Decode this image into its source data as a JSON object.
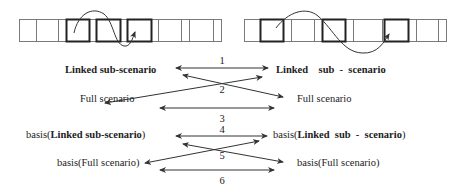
{
  "strips": [
    {
      "name": "left-strip",
      "top": 19,
      "bottom": 41,
      "cells": [
        {
          "x1": 19,
          "x2": 36,
          "bold": false
        },
        {
          "x1": 36,
          "x2": 58,
          "bold": false
        },
        {
          "x1": 58,
          "x2": 66,
          "bold": false
        },
        {
          "x1": 66,
          "x2": 89,
          "bold": true
        },
        {
          "x1": 89,
          "x2": 96,
          "bold": false
        },
        {
          "x1": 96,
          "x2": 120,
          "bold": true
        },
        {
          "x1": 120,
          "x2": 127,
          "bold": false
        },
        {
          "x1": 127,
          "x2": 151,
          "bold": true
        },
        {
          "x1": 151,
          "x2": 158,
          "bold": false
        },
        {
          "x1": 158,
          "x2": 181,
          "bold": false
        },
        {
          "x1": 181,
          "x2": 189,
          "bold": false
        },
        {
          "x1": 189,
          "x2": 213,
          "bold": false
        },
        {
          "x1": 213,
          "x2": 221,
          "bold": false
        }
      ],
      "curve": "M74,33 C78,14 92,6 104,14 C114,22 114,44 124,46 C130,47 132,40 135,32"
    },
    {
      "name": "right-strip",
      "top": 19,
      "bottom": 41,
      "cells": [
        {
          "x1": 244,
          "x2": 260,
          "bold": false
        },
        {
          "x1": 260,
          "x2": 283,
          "bold": true
        },
        {
          "x1": 283,
          "x2": 291,
          "bold": false
        },
        {
          "x1": 291,
          "x2": 314,
          "bold": false
        },
        {
          "x1": 314,
          "x2": 322,
          "bold": false
        },
        {
          "x1": 322,
          "x2": 345,
          "bold": true
        },
        {
          "x1": 345,
          "x2": 353,
          "bold": false
        },
        {
          "x1": 353,
          "x2": 382,
          "bold": false
        },
        {
          "x1": 382,
          "x2": 384,
          "bold": false
        },
        {
          "x1": 384,
          "x2": 408,
          "bold": true
        },
        {
          "x1": 408,
          "x2": 416,
          "bold": false
        },
        {
          "x1": 416,
          "x2": 438,
          "bold": false
        },
        {
          "x1": 438,
          "x2": 446,
          "bold": false
        }
      ],
      "curve": "M276,28 C288,12 306,6 318,16 C334,30 342,52 362,53 C378,54 384,42 389,34"
    }
  ],
  "groups": [
    {
      "left_top": {
        "prefix": "",
        "bold": "Linked sub-scenario",
        "suffix": "",
        "x": 65,
        "y": 64
      },
      "left_bottom": {
        "text": "Full scenario",
        "x": 80,
        "y": 93
      },
      "right_top": {
        "prefix": "",
        "bold": "Linked    sub  -  scenario",
        "suffix": "",
        "x": 276,
        "y": 64
      },
      "right_bottom": {
        "text": "Full scenario",
        "x": 297,
        "y": 93
      },
      "labels": [
        {
          "text": "1",
          "x": 216,
          "y": 55
        },
        {
          "text": "2",
          "x": 216,
          "y": 84
        },
        {
          "text": "3",
          "x": 216,
          "y": 113
        }
      ],
      "arrows": [
        {
          "x1": 176,
          "y1": 68,
          "x2": 268,
          "y2": 68,
          "double": true
        },
        {
          "x1": 105,
          "y1": 103,
          "x2": 262,
          "y2": 77,
          "double": true
        },
        {
          "x1": 183,
          "y1": 75,
          "x2": 283,
          "y2": 97,
          "double": true
        },
        {
          "x1": 160,
          "y1": 108,
          "x2": 274,
          "y2": 108,
          "double": true
        }
      ]
    },
    {
      "left_top": {
        "prefix": "basis(",
        "bold": "Linked sub-scenario",
        "suffix": ")",
        "x": 26,
        "y": 129
      },
      "left_bottom": {
        "text": "basis(Full scenario)",
        "x": 57,
        "y": 157
      },
      "right_top": {
        "prefix": "basis(",
        "bold": "Linked  sub  -  scenario",
        "suffix": ")",
        "x": 273,
        "y": 129
      },
      "right_bottom": {
        "text": "basis(Full scenario)",
        "x": 297,
        "y": 157
      },
      "labels": [
        {
          "text": "4",
          "x": 216,
          "y": 124
        },
        {
          "text": "5",
          "x": 216,
          "y": 150
        },
        {
          "text": "6",
          "x": 216,
          "y": 175
        }
      ],
      "arrows": [
        {
          "x1": 176,
          "y1": 136,
          "x2": 267,
          "y2": 136,
          "double": true
        },
        {
          "x1": 145,
          "y1": 163,
          "x2": 259,
          "y2": 141,
          "double": true
        },
        {
          "x1": 183,
          "y1": 144,
          "x2": 283,
          "y2": 162,
          "double": true
        },
        {
          "x1": 160,
          "y1": 170,
          "x2": 274,
          "y2": 170,
          "double": true
        }
      ]
    }
  ],
  "colors": {
    "thin_line": "#7a7a7a",
    "bold_line": "#222222",
    "arrow": "#333333",
    "text": "#222222"
  }
}
